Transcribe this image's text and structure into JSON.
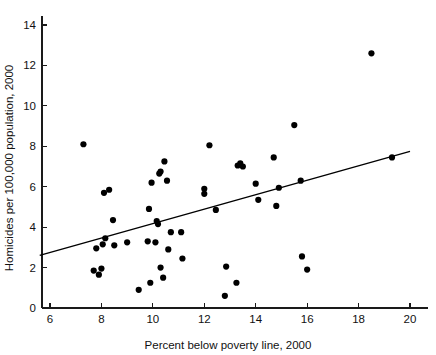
{
  "chart_data": {
    "type": "scatter",
    "title": "",
    "xlabel": "Percent below poverty line, 2000",
    "ylabel": "Homicides per 100,000 population, 2000",
    "xlim": [
      5.4,
      20.6
    ],
    "ylim": [
      0,
      14.8
    ],
    "xticks": [
      6,
      8,
      10,
      12,
      14,
      16,
      18,
      20
    ],
    "yticks": [
      0,
      2,
      4,
      6,
      8,
      10,
      12,
      14
    ],
    "xtick_labels": [
      "6",
      "8",
      "10",
      "12",
      "14",
      "16",
      "18",
      "20"
    ],
    "ytick_labels": [
      "0",
      "2",
      "4",
      "6",
      "8",
      "10",
      "12",
      "14"
    ],
    "grid": false,
    "legend": "none",
    "marker": "filled-circle",
    "marker_color": "#000000",
    "points": [
      {
        "x": 7.3,
        "y": 8.1
      },
      {
        "x": 7.7,
        "y": 1.85
      },
      {
        "x": 7.8,
        "y": 2.95
      },
      {
        "x": 7.9,
        "y": 1.65
      },
      {
        "x": 8.0,
        "y": 1.95
      },
      {
        "x": 8.05,
        "y": 3.15
      },
      {
        "x": 8.1,
        "y": 5.7
      },
      {
        "x": 8.15,
        "y": 3.45
      },
      {
        "x": 8.3,
        "y": 5.85
      },
      {
        "x": 8.45,
        "y": 4.35
      },
      {
        "x": 8.5,
        "y": 3.1
      },
      {
        "x": 9.0,
        "y": 3.25
      },
      {
        "x": 9.45,
        "y": 0.9
      },
      {
        "x": 9.8,
        "y": 3.3
      },
      {
        "x": 9.85,
        "y": 4.9
      },
      {
        "x": 9.9,
        "y": 1.25
      },
      {
        "x": 9.95,
        "y": 6.2
      },
      {
        "x": 10.1,
        "y": 3.25
      },
      {
        "x": 10.15,
        "y": 4.3
      },
      {
        "x": 10.2,
        "y": 4.15
      },
      {
        "x": 10.25,
        "y": 6.65
      },
      {
        "x": 10.3,
        "y": 6.75
      },
      {
        "x": 10.3,
        "y": 2.0
      },
      {
        "x": 10.4,
        "y": 1.5
      },
      {
        "x": 10.45,
        "y": 7.25
      },
      {
        "x": 10.55,
        "y": 6.3
      },
      {
        "x": 10.6,
        "y": 2.9
      },
      {
        "x": 10.7,
        "y": 3.75
      },
      {
        "x": 11.1,
        "y": 3.75
      },
      {
        "x": 11.15,
        "y": 2.45
      },
      {
        "x": 12.0,
        "y": 5.65
      },
      {
        "x": 12.0,
        "y": 5.9
      },
      {
        "x": 12.2,
        "y": 8.05
      },
      {
        "x": 12.45,
        "y": 4.85
      },
      {
        "x": 12.8,
        "y": 0.6
      },
      {
        "x": 12.85,
        "y": 2.05
      },
      {
        "x": 13.25,
        "y": 1.25
      },
      {
        "x": 13.3,
        "y": 7.05
      },
      {
        "x": 13.4,
        "y": 7.15
      },
      {
        "x": 13.5,
        "y": 7.0
      },
      {
        "x": 14.0,
        "y": 6.15
      },
      {
        "x": 14.1,
        "y": 5.35
      },
      {
        "x": 14.7,
        "y": 7.45
      },
      {
        "x": 14.8,
        "y": 5.05
      },
      {
        "x": 14.9,
        "y": 5.95
      },
      {
        "x": 15.5,
        "y": 9.05
      },
      {
        "x": 15.75,
        "y": 6.3
      },
      {
        "x": 15.8,
        "y": 2.55
      },
      {
        "x": 16.0,
        "y": 1.9
      },
      {
        "x": 18.5,
        "y": 12.6
      },
      {
        "x": 19.3,
        "y": 7.45
      }
    ],
    "fit_line": {
      "type": "linear-regression",
      "x1": 5.6,
      "y1": 2.6,
      "x2": 20.0,
      "y2": 7.75
    }
  }
}
